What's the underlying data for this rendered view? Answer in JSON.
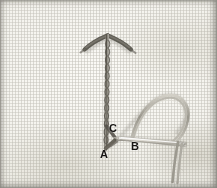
{
  "photo": {
    "subject": "embroidery-stitch-demonstration",
    "description": "Close-up photograph of a chain stitch worked vertically on pale linen fabric, with a sewing needle and thread forming a loop at the lower right.",
    "background_color": "#f2f1ec",
    "fabric": "linen-weave",
    "thread_color": "#8d8a80",
    "stitch_color": "#6e6b62"
  },
  "labels": [
    {
      "id": "A",
      "text": "A",
      "meaning": "bottom-of-chain-stitch-insertion-point"
    },
    {
      "id": "B",
      "text": "B",
      "meaning": "needle-emergence-point-to-the-right"
    },
    {
      "id": "C",
      "text": "C",
      "meaning": "loop-crossing-point-above-A"
    }
  ],
  "elements": {
    "chain_stitch_line": "vertical-chain-stitch",
    "fly_stitch_arms": "two-angled-thread-arms-at-top",
    "needle": "sewing-needle-horizontal",
    "thread_loop": "curved-working-thread-loop",
    "thread_tails": "two-thread-tails-descending"
  }
}
